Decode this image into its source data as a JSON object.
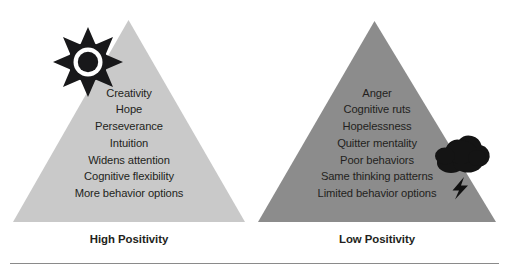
{
  "figure": {
    "title_present": false,
    "background_color": "#ffffff",
    "baseline_color": "#8a8a8a"
  },
  "left_panel": {
    "name": "High Positivity panel",
    "axis_label": "High Positivity",
    "pyramid_color": "#c9c9c9",
    "icon": "sun-icon",
    "icon_color": "#1a1a1a",
    "items": [
      "Creativity",
      "Hope",
      "Perseverance",
      "Intuition",
      "Widens attention",
      "Cognitive flexibility",
      "More behavior options"
    ]
  },
  "right_panel": {
    "name": "Low Positivity panel",
    "axis_label": "Low Positivity",
    "pyramid_color": "#8c8c8c",
    "icon": "storm-cloud-icon",
    "icon_secondary": "lightning-bolt-icon",
    "icon_color": "#141414",
    "items": [
      "Anger",
      "Cognitive ruts",
      "Hopelessness",
      "Quitter mentality",
      "Poor behaviors",
      "Same thinking patterns",
      "Limited behavior options"
    ]
  }
}
